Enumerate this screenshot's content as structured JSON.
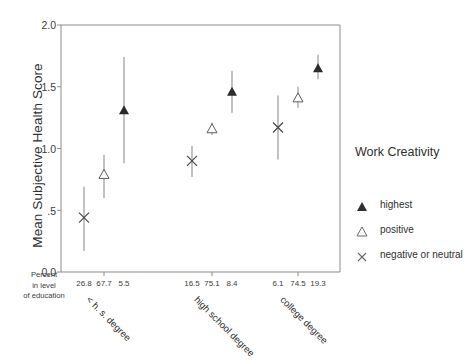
{
  "chart_data": {
    "type": "scatter",
    "title": "",
    "xlabel": "",
    "ylabel": "Mean Subjective Health Score",
    "ylim": [
      0.0,
      2.0
    ],
    "yticks": [
      0.0,
      0.5,
      1.0,
      1.5,
      2.0
    ],
    "ytick_labels": [
      "0.0",
      ".5",
      "1.0",
      "1.5",
      "2.0"
    ],
    "grid": false,
    "legend_position": "right",
    "legend_title": "Work Creativity",
    "percent_caption": "Percent in level of education",
    "percent_caption_lines": [
      "Percent",
      "in level",
      "of education"
    ],
    "groups": [
      {
        "label": "< h. s. degree",
        "percents": [
          "26.8",
          "67.7",
          "5.5"
        ],
        "points": [
          {
            "series": "negative or neutral",
            "percent": "26.8",
            "value": 0.44,
            "low": 0.17,
            "high": 0.69
          },
          {
            "series": "positive",
            "percent": "67.7",
            "value": 0.79,
            "low": 0.6,
            "high": 0.95
          },
          {
            "series": "highest",
            "percent": "5.5",
            "value": 1.31,
            "low": 0.88,
            "high": 1.74
          }
        ]
      },
      {
        "label": "high school degree",
        "percents": [
          "16.5",
          "75.1",
          "8.4"
        ],
        "points": [
          {
            "series": "negative or neutral",
            "percent": "16.5",
            "value": 0.9,
            "low": 0.77,
            "high": 1.02
          },
          {
            "series": "positive",
            "percent": "75.1",
            "value": 1.16,
            "low": 1.11,
            "high": 1.21
          },
          {
            "series": "highest",
            "percent": "8.4",
            "value": 1.46,
            "low": 1.29,
            "high": 1.63
          }
        ]
      },
      {
        "label": "college degree",
        "percents": [
          "6.1",
          "74.5",
          "19.3"
        ],
        "points": [
          {
            "series": "negative or neutral",
            "percent": "6.1",
            "value": 1.17,
            "low": 0.91,
            "high": 1.43
          },
          {
            "series": "positive",
            "percent": "74.5",
            "value": 1.41,
            "low": 1.33,
            "high": 1.5
          },
          {
            "series": "highest",
            "percent": "19.3",
            "value": 1.65,
            "low": 1.56,
            "high": 1.76
          }
        ]
      }
    ],
    "series_styles": [
      {
        "name": "highest",
        "marker": "filled-triangle",
        "color": "#3a3a3a"
      },
      {
        "name": "positive",
        "marker": "open-triangle",
        "color": "#3a3a3a"
      },
      {
        "name": "negative or neutral",
        "marker": "cross",
        "color": "#3a3a3a"
      }
    ]
  },
  "legend": {
    "title": "Work Creativity",
    "items": [
      {
        "label": "highest",
        "marker": "filled-triangle"
      },
      {
        "label": "positive",
        "marker": "open-triangle"
      },
      {
        "label": "negative or neutral",
        "marker": "cross"
      }
    ]
  },
  "axis": {
    "y_title": "Mean Subjective Health Score",
    "y_tick_labels": [
      "2.0",
      "1.5",
      "1.0",
      ".5",
      "0.0"
    ],
    "percent_caption_lines": [
      "Percent",
      "in level",
      "of education"
    ]
  }
}
